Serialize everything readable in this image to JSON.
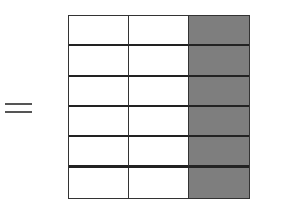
{
  "diagram": {
    "operator": "=",
    "grid": {
      "rows": 6,
      "columns": 3,
      "shaded_columns": [
        3
      ],
      "shaded_cells": 6,
      "total_cells": 18,
      "shade_color": "#8c8c8c",
      "line_color": "#333333"
    }
  }
}
